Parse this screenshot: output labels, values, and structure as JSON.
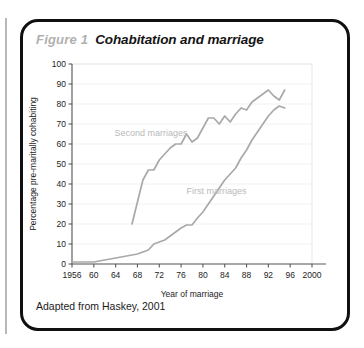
{
  "figure": {
    "label": "Figure 1",
    "title": "Cohabitation and marriage",
    "caption": "Adapted from Haskey, 2001"
  },
  "chart_data": {
    "type": "line",
    "title": "Cohabitation and marriage",
    "xlabel": "Year of marriage",
    "ylabel": "Percentage pre-maritally cohabiting",
    "xlim": [
      1956,
      2000
    ],
    "ylim": [
      0,
      100
    ],
    "xticks": [
      1956,
      1960,
      1964,
      1968,
      1972,
      1976,
      1980,
      1984,
      1988,
      1992,
      1996,
      2000
    ],
    "xtick_labels": [
      "1956",
      "60",
      "64",
      "68",
      "72",
      "76",
      "80",
      "84",
      "88",
      "92",
      "96",
      "2000"
    ],
    "yticks": [
      0,
      10,
      20,
      30,
      40,
      50,
      60,
      70,
      80,
      90,
      100
    ],
    "ytick_labels": [
      "0",
      "10",
      "20",
      "30",
      "40",
      "50",
      "60",
      "70",
      "80",
      "90",
      "100"
    ],
    "grid": true,
    "legend": "inline-annotations",
    "series": [
      {
        "name": "Second marriages",
        "label_x": 1970.5,
        "label_y": 64,
        "x": [
          1967,
          1968,
          1969,
          1970,
          1971,
          1972,
          1973,
          1974,
          1975,
          1976,
          1977,
          1978,
          1979,
          1980,
          1981,
          1982,
          1983,
          1984,
          1985,
          1986,
          1987,
          1988,
          1989,
          1990,
          1991,
          1992,
          1993,
          1994,
          1995
        ],
        "y": [
          20,
          31,
          42,
          47,
          47,
          52,
          55,
          58,
          60,
          60,
          65,
          61,
          63,
          68,
          73,
          73,
          70,
          74,
          71,
          75,
          78,
          77,
          81,
          83,
          85,
          87,
          84,
          82,
          87
        ]
      },
      {
        "name": "First marriages",
        "label_x": 1982.5,
        "label_y": 35,
        "x": [
          1956,
          1957,
          1958,
          1959,
          1960,
          1961,
          1962,
          1963,
          1964,
          1965,
          1966,
          1967,
          1968,
          1969,
          1970,
          1971,
          1972,
          1973,
          1974,
          1975,
          1976,
          1977,
          1978,
          1979,
          1980,
          1981,
          1982,
          1983,
          1984,
          1985,
          1986,
          1987,
          1988,
          1989,
          1990,
          1991,
          1992,
          1993,
          1994,
          1995
        ],
        "y": [
          1,
          1,
          1,
          1,
          1,
          1.5,
          2,
          2.5,
          3,
          3.5,
          4,
          4.5,
          5,
          6,
          7,
          10,
          11,
          12,
          14,
          16,
          18,
          19.5,
          19.5,
          23,
          26,
          30,
          34,
          38,
          42,
          45,
          48,
          53,
          57,
          62,
          66,
          70,
          74,
          77,
          79,
          78
        ]
      }
    ]
  }
}
